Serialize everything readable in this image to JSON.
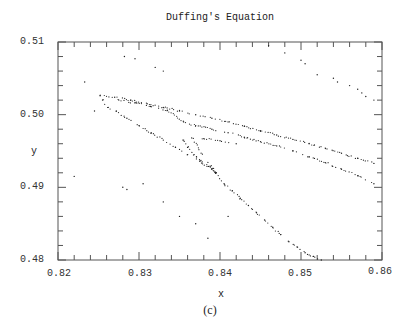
{
  "chart_data": {
    "type": "scatter",
    "title": "Duffing's Equation",
    "xlabel": "x",
    "ylabel": "y",
    "caption": "(c)",
    "xlim": [
      0.82,
      0.86
    ],
    "ylim": [
      0.48,
      0.51
    ],
    "xticks": [
      "0.82",
      "0.83",
      "0.84",
      "0.85",
      "0.86"
    ],
    "yticks": [
      "0.51",
      "0.50",
      "0.49",
      "0.48"
    ],
    "x_minor_ticks_per_major": 5,
    "y_minor_ticks_per_major": 5,
    "grid": false,
    "legend": null,
    "marker": "dot",
    "color": "#222222",
    "series": [
      {
        "name": "upper-outer-branch",
        "points": [
          [
            0.8252,
            0.5026
          ],
          [
            0.827,
            0.5024
          ],
          [
            0.829,
            0.502
          ],
          [
            0.831,
            0.5015
          ],
          [
            0.833,
            0.501
          ],
          [
            0.835,
            0.5005
          ],
          [
            0.837,
            0.5
          ],
          [
            0.839,
            0.4995
          ],
          [
            0.841,
            0.499
          ],
          [
            0.843,
            0.4984
          ],
          [
            0.845,
            0.4978
          ],
          [
            0.847,
            0.4972
          ],
          [
            0.849,
            0.4966
          ],
          [
            0.851,
            0.496
          ],
          [
            0.853,
            0.4954
          ],
          [
            0.855,
            0.4947
          ],
          [
            0.857,
            0.494
          ],
          [
            0.859,
            0.4933
          ]
        ]
      },
      {
        "name": "upper-inner-branch",
        "points": [
          [
            0.8275,
            0.502
          ],
          [
            0.8295,
            0.5016
          ],
          [
            0.8315,
            0.5011
          ],
          [
            0.8335,
            0.5006
          ],
          [
            0.8355,
            0.499
          ],
          [
            0.837,
            0.4985
          ],
          [
            0.839,
            0.498
          ],
          [
            0.841,
            0.4975
          ],
          [
            0.843,
            0.4969
          ],
          [
            0.845,
            0.4963
          ],
          [
            0.847,
            0.4957
          ],
          [
            0.849,
            0.495
          ],
          [
            0.851,
            0.4942
          ],
          [
            0.853,
            0.4934
          ],
          [
            0.855,
            0.4925
          ],
          [
            0.857,
            0.4916
          ],
          [
            0.859,
            0.4905
          ]
        ]
      },
      {
        "name": "middle-fold-descending",
        "points": [
          [
            0.8255,
            0.502
          ],
          [
            0.8262,
            0.501
          ],
          [
            0.8272,
            0.5005
          ],
          [
            0.8285,
            0.4995
          ],
          [
            0.83,
            0.4985
          ],
          [
            0.8315,
            0.4975
          ],
          [
            0.833,
            0.4965
          ],
          [
            0.8345,
            0.4955
          ],
          [
            0.836,
            0.4945
          ],
          [
            0.8375,
            0.4936
          ],
          [
            0.839,
            0.4925
          ],
          [
            0.8395,
            0.492
          ]
        ]
      },
      {
        "name": "inner-cusp",
        "points": [
          [
            0.8355,
            0.4965
          ],
          [
            0.836,
            0.4955
          ],
          [
            0.8368,
            0.4945
          ],
          [
            0.8378,
            0.4935
          ],
          [
            0.8388,
            0.4928
          ],
          [
            0.8395,
            0.492
          ],
          [
            0.8365,
            0.4968
          ],
          [
            0.838,
            0.4967
          ],
          [
            0.84,
            0.4964
          ],
          [
            0.842,
            0.496
          ]
        ]
      },
      {
        "name": "lower-branch",
        "points": [
          [
            0.8395,
            0.492
          ],
          [
            0.8405,
            0.4905
          ],
          [
            0.8415,
            0.4895
          ],
          [
            0.8425,
            0.4885
          ],
          [
            0.8435,
            0.4875
          ],
          [
            0.8445,
            0.4865
          ],
          [
            0.8455,
            0.4855
          ],
          [
            0.8465,
            0.4845
          ],
          [
            0.8475,
            0.4835
          ],
          [
            0.8485,
            0.4825
          ],
          [
            0.8495,
            0.4818
          ],
          [
            0.8505,
            0.481
          ],
          [
            0.8515,
            0.4805
          ],
          [
            0.8525,
            0.48
          ]
        ]
      },
      {
        "name": "top-right-scatter",
        "points": [
          [
            0.846,
            0.5095
          ],
          [
            0.848,
            0.5085
          ],
          [
            0.85,
            0.5075
          ],
          [
            0.8505,
            0.507
          ],
          [
            0.852,
            0.5055
          ],
          [
            0.854,
            0.505
          ],
          [
            0.8545,
            0.5045
          ],
          [
            0.856,
            0.504
          ],
          [
            0.857,
            0.5035
          ],
          [
            0.8575,
            0.503
          ],
          [
            0.858,
            0.5025
          ],
          [
            0.859,
            0.502
          ]
        ]
      },
      {
        "name": "sparse-scatter",
        "points": [
          [
            0.8233,
            0.5045
          ],
          [
            0.8245,
            0.5005
          ],
          [
            0.8282,
            0.508
          ],
          [
            0.8295,
            0.5077
          ],
          [
            0.832,
            0.5065
          ],
          [
            0.833,
            0.506
          ],
          [
            0.822,
            0.4915
          ],
          [
            0.828,
            0.49
          ],
          [
            0.8285,
            0.4897
          ],
          [
            0.8305,
            0.4905
          ],
          [
            0.833,
            0.488
          ],
          [
            0.835,
            0.486
          ],
          [
            0.837,
            0.485
          ],
          [
            0.8385,
            0.483
          ],
          [
            0.841,
            0.486
          ]
        ]
      }
    ]
  }
}
